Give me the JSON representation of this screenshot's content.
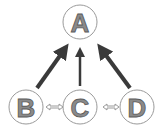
{
  "diagram": {
    "type": "directed-graph",
    "nodes": [
      {
        "id": "A",
        "label": "A",
        "cx": 84,
        "cy": 22,
        "r": 17
      },
      {
        "id": "B",
        "label": "B",
        "cx": 22,
        "cy": 108,
        "r": 17
      },
      {
        "id": "C",
        "label": "C",
        "cx": 84,
        "cy": 108,
        "r": 17
      },
      {
        "id": "D",
        "label": "D",
        "cx": 140,
        "cy": 108,
        "r": 17
      }
    ],
    "edges": [
      {
        "from": "B",
        "to": "A",
        "style": "dark-directed"
      },
      {
        "from": "C",
        "to": "A",
        "style": "dark-directed"
      },
      {
        "from": "D",
        "to": "A",
        "style": "dark-directed"
      },
      {
        "from": "B",
        "to": "C",
        "style": "hollow-bidirectional"
      },
      {
        "from": "C",
        "to": "D",
        "style": "hollow-bidirectional"
      }
    ],
    "colors": {
      "arrow": "#3a3a3a",
      "node_outline": "#9a9a9a",
      "label_fill": "#8a8a8a",
      "background": "#ffffff"
    }
  }
}
